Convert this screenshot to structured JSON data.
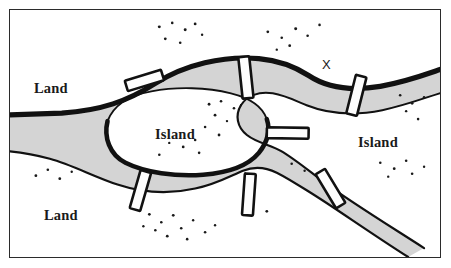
{
  "figure": {
    "background_color": "#ffffff",
    "frame_color": "#2b2b2b"
  },
  "colors": {
    "water": "#d4d4d4",
    "water_outline": "#111111",
    "land": "#ffffff",
    "bridge_fill": "#fdfdfd",
    "bridge_outline": "#111111",
    "text": "#1a1a1a",
    "stipple": "#1a1a1a"
  },
  "labels": {
    "land_upper": "Land",
    "land_lower": "Land",
    "island_center": "Island",
    "island_right": "Island",
    "x_marker": "X"
  },
  "regions": [
    {
      "id": "land-upper",
      "name": "Land",
      "position": "upper-left"
    },
    {
      "id": "land-lower",
      "name": "Land",
      "position": "lower-left"
    },
    {
      "id": "island-center",
      "name": "Island",
      "position": "center"
    },
    {
      "id": "island-right",
      "name": "Island",
      "position": "right"
    }
  ],
  "bridges": [
    {
      "id": "bridge-1",
      "label": "",
      "position": "upper-left",
      "cx": 135,
      "cy": 71,
      "angle": -17,
      "length": 38,
      "width": 11
    },
    {
      "id": "bridge-2",
      "label": "",
      "position": "upper-middle",
      "cx": 237,
      "cy": 68,
      "angle": -6,
      "length": 42,
      "width": 11
    },
    {
      "id": "bridge-3",
      "label": "",
      "position": "upper-right",
      "cx": 348,
      "cy": 86,
      "angle": 14,
      "length": 40,
      "width": 11
    },
    {
      "id": "bridge-4",
      "label": "",
      "position": "center",
      "cx": 288,
      "cy": 133,
      "angle": 88,
      "length": 30,
      "width": 11
    },
    {
      "id": "bridge-5",
      "label": "",
      "position": "lower-left",
      "cx": 131,
      "cy": 182,
      "angle": 16,
      "length": 40,
      "width": 11
    },
    {
      "id": "bridge-6",
      "label": "",
      "position": "lower-middle",
      "cx": 240,
      "cy": 186,
      "angle": 4,
      "length": 42,
      "width": 11
    },
    {
      "id": "bridge-7",
      "label": "",
      "position": "lower-right",
      "cx": 329,
      "cy": 185,
      "angle": -31,
      "length": 40,
      "width": 11
    }
  ],
  "bridge_count": 7
}
